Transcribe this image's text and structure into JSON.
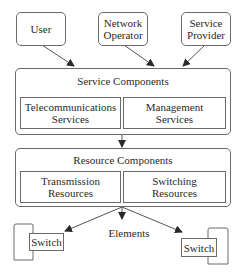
{
  "diagram": {
    "actors": [
      {
        "line1": "User",
        "line2": ""
      },
      {
        "line1": "Network",
        "line2": "Operator"
      },
      {
        "line1": "Service",
        "line2": "Provider"
      }
    ],
    "service_components": {
      "title": "Service Components",
      "children": [
        {
          "line1": "Telecommunications",
          "line2": "Services"
        },
        {
          "line1": "Management",
          "line2": "Services"
        }
      ]
    },
    "resource_components": {
      "title": "Resource Components",
      "children": [
        {
          "line1": "Transmission",
          "line2": "Resources"
        },
        {
          "line1": "Switching",
          "line2": "Resources"
        }
      ]
    },
    "elements": {
      "label": "Elements",
      "switches": [
        {
          "label": "Switch"
        },
        {
          "label": "Switch"
        }
      ]
    },
    "colors": {
      "line": "#6a6a6a",
      "arrow": "#2a2a2a",
      "background": "#ffffff"
    }
  }
}
